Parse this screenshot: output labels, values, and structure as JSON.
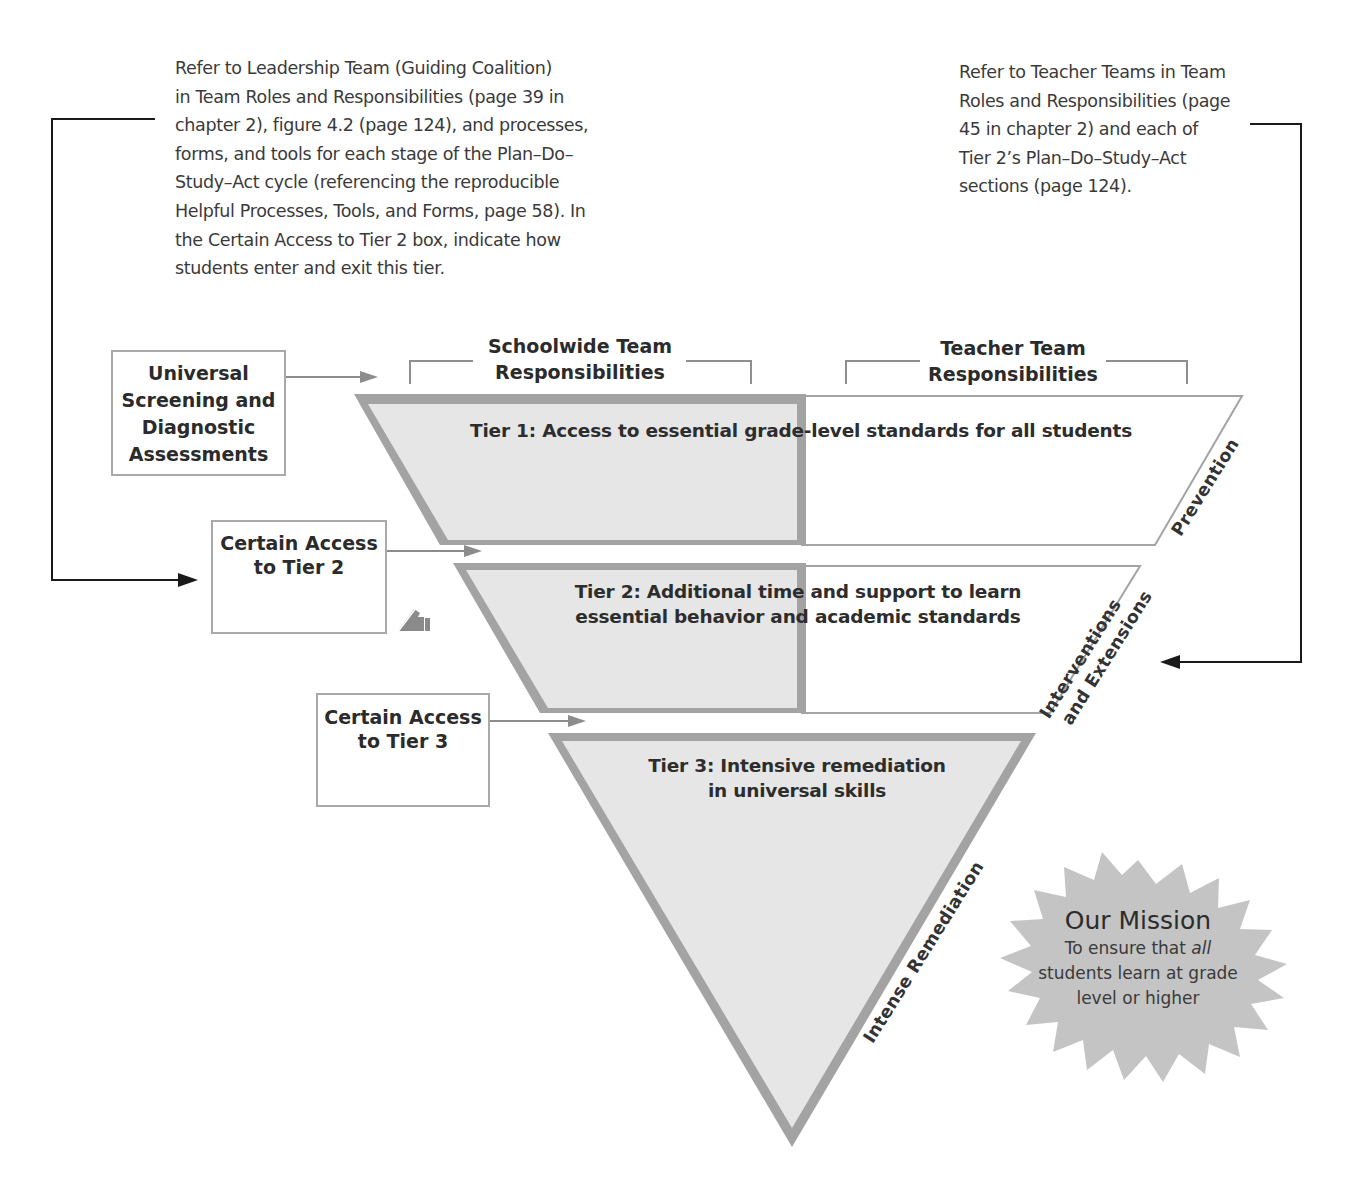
{
  "notes": {
    "leadership": {
      "lines": [
        "Refer to Leadership Team (Guiding Coalition)",
        "in Team Roles and Responsibilities (page 39 in",
        "chapter 2), figure 4.2 (page 124), and processes,",
        "forms, and tools for each stage of the Plan–Do–",
        "Study–Act cycle (referencing the reproducible",
        "Helpful Processes, Tools, and Forms, page 58). In",
        "the Certain Access to Tier 2 box, indicate how",
        "students enter and exit this tier."
      ]
    },
    "teacher": {
      "lines": [
        "Refer to Teacher Teams in Team",
        "Roles and Responsibilities (page",
        "45 in chapter 2) and each of",
        "Tier 2’s Plan–Do–Study–Act",
        "sections (page 124)."
      ]
    }
  },
  "headers": {
    "schoolwide": {
      "line1": "Schoolwide Team",
      "line2": "Responsibilities"
    },
    "teacher": {
      "line1": "Teacher Team",
      "line2": "Responsibilities"
    }
  },
  "boxes": {
    "screening": {
      "lines": [
        "Universal",
        "Screening and",
        "Diagnostic",
        "Assessments"
      ]
    },
    "tier2_access": {
      "lines": [
        "Certain Access",
        "to Tier 2"
      ],
      "icon": "pencil-write-icon"
    },
    "tier3_access": {
      "lines": [
        "Certain Access",
        "to Tier 3"
      ]
    }
  },
  "tiers": {
    "tier1": {
      "lines": [
        "Tier 1: Access to essential grade-level standards for all students"
      ],
      "side_label": [
        "Prevention"
      ]
    },
    "tier2": {
      "lines": [
        "Tier 2: Additional time and support to learn",
        "essential behavior and academic standards"
      ],
      "side_label": [
        "Interventions",
        "and Extensions"
      ]
    },
    "tier3": {
      "lines": [
        "Tier 3: Intensive remediation",
        "in universal skills"
      ],
      "side_label": [
        "Intense Remediation"
      ]
    }
  },
  "mission": {
    "title": "Our Mission",
    "line1_prefix": "To ensure that ",
    "line1_emphasis": "all",
    "line2": "students learn at grade",
    "line3": "level or higher"
  },
  "colors": {
    "tier_fill": "#e6e6e6",
    "tier_border": "#a3a3a3",
    "box_border": "#a9a9a9",
    "connector": "#1a1a1a",
    "arrow_gray": "#8c8c8c",
    "mission_fill": "#c4c4c4"
  }
}
